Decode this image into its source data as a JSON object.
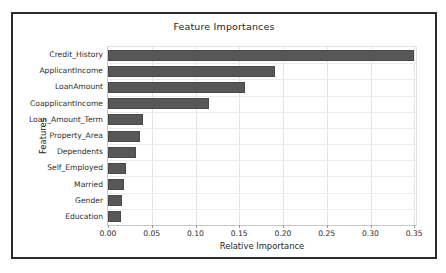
{
  "chart_data": {
    "type": "bar",
    "orientation": "horizontal",
    "title": "Feature Importances",
    "xlabel": "Relative Importance",
    "ylabel": "Features",
    "categories": [
      "Credit_History",
      "ApplicantIncome",
      "LoanAmount",
      "CoapplicantIncome",
      "Loan_Amount_Term",
      "Property_Area",
      "Dependents",
      "Self_Employed",
      "Married",
      "Gender",
      "Education"
    ],
    "values": [
      0.35,
      0.191,
      0.156,
      0.115,
      0.04,
      0.036,
      0.032,
      0.02,
      0.018,
      0.016,
      0.015
    ],
    "xlim": [
      0.0,
      0.352
    ],
    "xticks": [
      "0.00",
      "0.05",
      "0.10",
      "0.15",
      "0.20",
      "0.25",
      "0.30",
      "0.35"
    ],
    "xtick_values": [
      0.0,
      0.05,
      0.1,
      0.15,
      0.2,
      0.25,
      0.3,
      0.35
    ],
    "grid": true,
    "legend": null,
    "bar_color": "#575757",
    "background_color": "#ffffff",
    "frame_color": "#2b2b2b",
    "grid_color": "#e4e4e4"
  }
}
